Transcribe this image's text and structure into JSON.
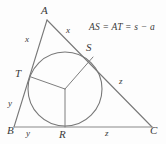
{
  "figure": {
    "type": "geometry-diagram",
    "colors": {
      "background": "#fdfdfd",
      "stroke": "#777777",
      "text": "#3a3a3a"
    },
    "formula": "AS = AT = s − a",
    "vertices": [
      {
        "name": "A",
        "label": "A",
        "label_x": 41,
        "label_y": 5,
        "point_x": 47,
        "point_y": 20
      },
      {
        "name": "B",
        "label": "B",
        "label_x": 7,
        "label_y": 125,
        "point_x": 14,
        "point_y": 127
      },
      {
        "name": "C",
        "label": "C",
        "label_x": 150,
        "label_y": 125,
        "point_x": 152,
        "point_y": 127
      }
    ],
    "tangency_points": [
      {
        "name": "T",
        "label": "T",
        "label_x": 15,
        "label_y": 68,
        "point_x": 31,
        "point_y": 77
      },
      {
        "name": "S",
        "label": "S",
        "label_x": 86,
        "label_y": 42,
        "point_x": 93,
        "point_y": 57
      },
      {
        "name": "R",
        "label": "R",
        "label_x": 59,
        "label_y": 129,
        "point_x": 65,
        "point_y": 127
      }
    ],
    "incircle": {
      "center_x": 65,
      "center_y": 89,
      "radius": 37
    },
    "incenter": {
      "x": 65,
      "y": 89
    },
    "segment_labels": [
      {
        "name": "x-on-AB",
        "label": "x",
        "x": 25,
        "y": 35
      },
      {
        "name": "x-on-AC",
        "label": "x",
        "x": 66,
        "y": 26
      },
      {
        "name": "y-on-AB",
        "label": "y",
        "x": 8,
        "y": 99
      },
      {
        "name": "y-on-BC",
        "label": "y",
        "x": 26,
        "y": 129
      },
      {
        "name": "z-on-AC",
        "label": "z",
        "x": 119,
        "y": 77
      },
      {
        "name": "z-on-BC",
        "label": "z",
        "x": 105,
        "y": 129
      }
    ],
    "formula_position": {
      "x": 89,
      "y": 22
    }
  }
}
